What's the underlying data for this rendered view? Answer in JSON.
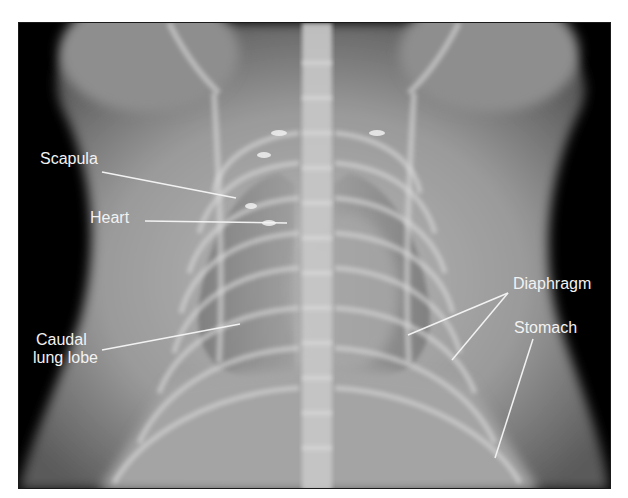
{
  "figure": {
    "background_color": "#000000",
    "label_color": "#f2f2f2",
    "labels": [
      {
        "id": "scapula",
        "text": "Scapula",
        "x": 40,
        "y": 150
      },
      {
        "id": "heart",
        "text": "Heart",
        "x": 90,
        "y": 209
      },
      {
        "id": "caudal-lung-lobe-line1",
        "text": "Caudal",
        "x": 36,
        "y": 331
      },
      {
        "id": "caudal-lung-lobe-line2",
        "text": "lung lobe",
        "x": 33,
        "y": 349
      },
      {
        "id": "diaphragm",
        "text": "Diaphragm",
        "x": 513,
        "y": 275
      },
      {
        "id": "stomach",
        "text": "Stomach",
        "x": 514,
        "y": 319
      }
    ],
    "leader_lines": [
      {
        "target": "scapula",
        "x1": 102,
        "y1": 172,
        "x2": 236,
        "y2": 198
      },
      {
        "target": "heart",
        "x1": 145,
        "y1": 221,
        "x2": 287,
        "y2": 223
      },
      {
        "target": "caudal-lung-lobe",
        "x1": 102,
        "y1": 350,
        "x2": 240,
        "y2": 324
      },
      {
        "target": "diaphragm-a",
        "x1": 508,
        "y1": 293,
        "x2": 408,
        "y2": 335
      },
      {
        "target": "diaphragm-b",
        "x1": 508,
        "y1": 293,
        "x2": 452,
        "y2": 360
      },
      {
        "target": "stomach",
        "x1": 533,
        "y1": 339,
        "x2": 495,
        "y2": 458
      }
    ]
  }
}
